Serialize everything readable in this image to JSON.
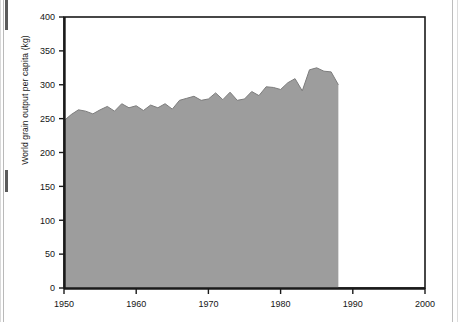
{
  "chart_data": {
    "type": "area",
    "title": "",
    "xlabel": "",
    "ylabel": "World grain output per capita (kg)",
    "xlim": [
      1950,
      2000
    ],
    "ylim": [
      0,
      400
    ],
    "grid": false,
    "legend": null,
    "xticks": [
      "1950",
      "1960",
      "1970",
      "1980",
      "1990",
      "2000"
    ],
    "yticks": [
      "0",
      "50",
      "100",
      "150",
      "200",
      "250",
      "300",
      "350",
      "400"
    ],
    "series_name": "World grain output per capita",
    "fill_color": "#9d9d9d",
    "line_color": "#7a7a7a",
    "axis_color": "#1a1a1a",
    "x": [
      1950,
      1951,
      1952,
      1953,
      1954,
      1955,
      1956,
      1957,
      1958,
      1959,
      1960,
      1961,
      1962,
      1963,
      1964,
      1965,
      1966,
      1967,
      1968,
      1969,
      1970,
      1971,
      1972,
      1973,
      1974,
      1975,
      1976,
      1977,
      1978,
      1979,
      1980,
      1981,
      1982,
      1983,
      1984,
      1985,
      1986,
      1987,
      1988
    ],
    "values": [
      247,
      256,
      263,
      261,
      257,
      263,
      268,
      261,
      272,
      266,
      269,
      262,
      270,
      266,
      272,
      264,
      277,
      280,
      283,
      277,
      279,
      288,
      278,
      289,
      277,
      279,
      290,
      284,
      297,
      296,
      293,
      303,
      309,
      291,
      322,
      325,
      320,
      319,
      300
    ],
    "annotations": [
      {
        "text": "Data series ends at 1988; axis extends to 2000",
        "visible": false
      }
    ]
  },
  "figure": {
    "ytick_labels": [
      "400",
      "350",
      "300",
      "250",
      "200",
      "150",
      "100",
      "50",
      "0"
    ],
    "xtick_labels": [
      "1950",
      "1960",
      "1970",
      "1980",
      "1990",
      "2000"
    ],
    "y_axis_title": "World grain output per capita (kg)"
  }
}
